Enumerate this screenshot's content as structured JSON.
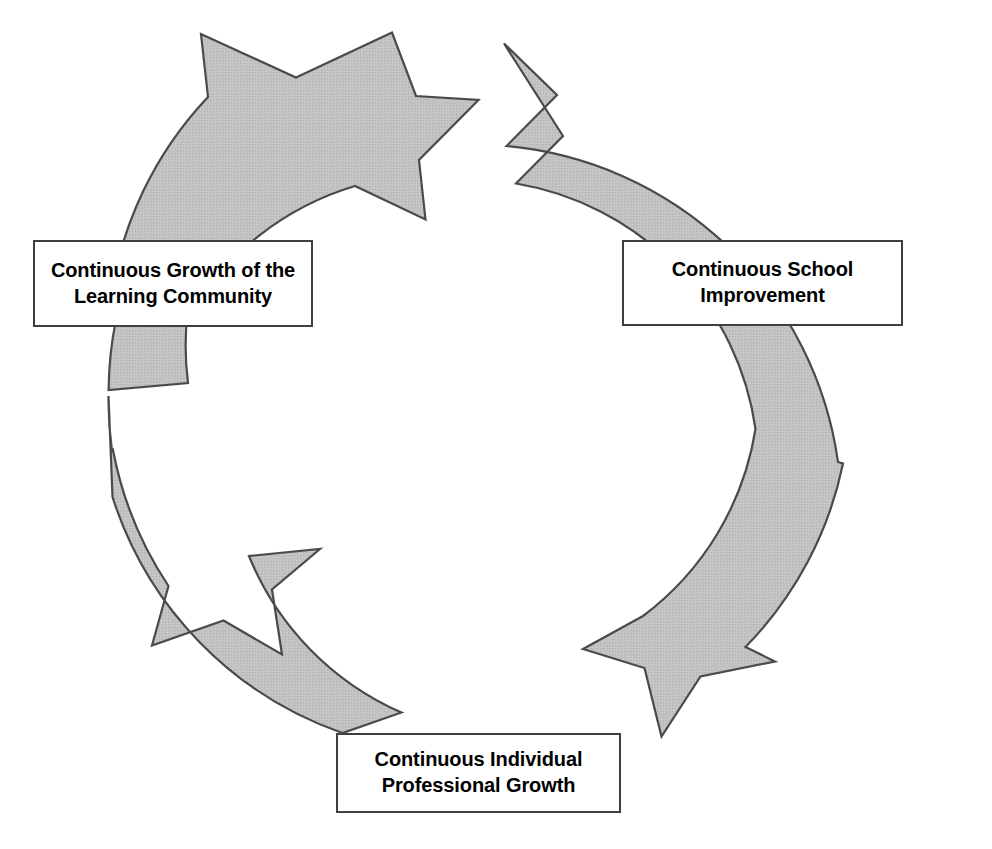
{
  "diagram": {
    "type": "cyclical-process",
    "direction": "clockwise",
    "background_color": "#ffffff",
    "arrow_fill_color": "#bfbfbf",
    "arrow_stroke_color": "#4a4a4a",
    "box_border_color": "#3f3f3f",
    "box_fill_color": "#ffffff",
    "text_color": "#000000",
    "nodes": [
      {
        "id": "continuous-growth-learning-community",
        "label": "Continuous Growth of the\nLearning Community",
        "line1": "Continuous Growth of the",
        "line2": "Learning Community",
        "position": "left"
      },
      {
        "id": "continuous-school-improvement",
        "label": "Continuous School\nImprovement",
        "line1": "Continuous School",
        "line2": "Improvement",
        "position": "right"
      },
      {
        "id": "continuous-individual-professional-growth",
        "label": "Continuous Individual\nProfessional Growth",
        "line1": "Continuous Individual",
        "line2": "Professional Growth",
        "position": "bottom"
      }
    ],
    "arrows": [
      {
        "id": "arrow-top",
        "from": "continuous-growth-learning-community",
        "to": "continuous-school-improvement",
        "points_toward": "right"
      },
      {
        "id": "arrow-right",
        "from": "continuous-school-improvement",
        "to": "continuous-individual-professional-growth",
        "points_toward": "down-left"
      },
      {
        "id": "arrow-bottom-left",
        "from": "continuous-individual-professional-growth",
        "to": "continuous-growth-learning-community",
        "points_toward": "up-left"
      }
    ]
  }
}
